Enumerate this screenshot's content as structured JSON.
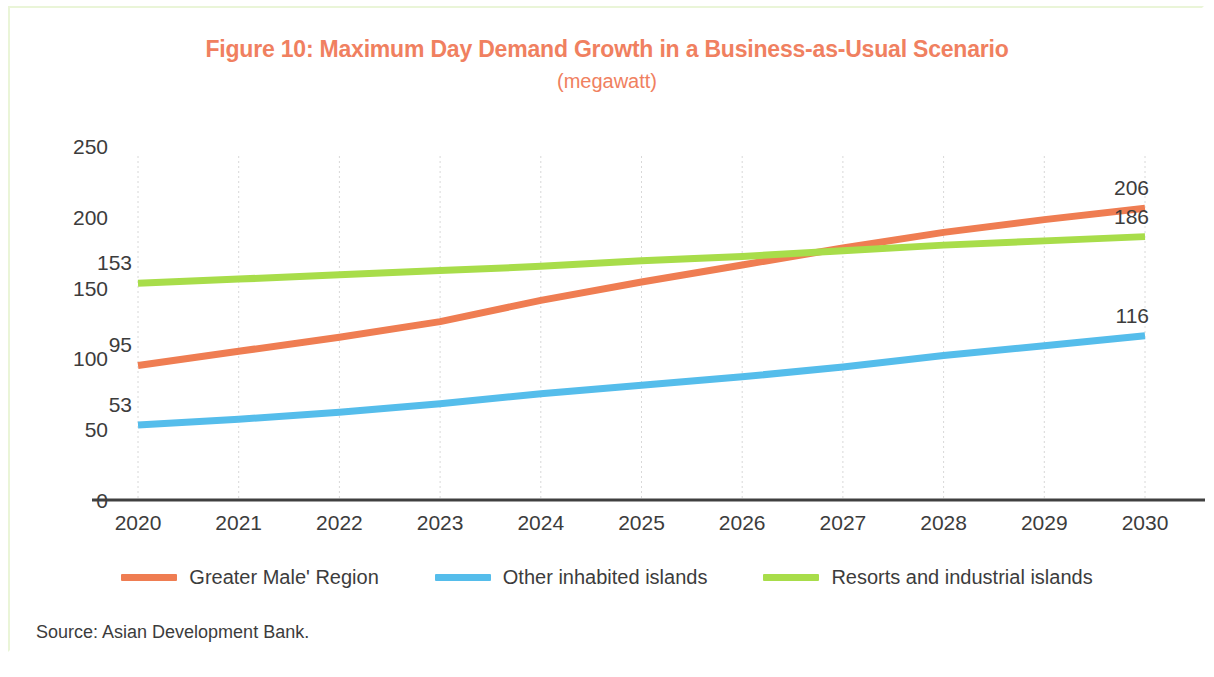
{
  "figure": {
    "title": "Figure 10: Maximum Day Demand Growth in a Business-as-Usual Scenario",
    "subtitle": "(megawatt)",
    "source": "Source: Asian Development Bank."
  },
  "colors": {
    "title": "#f08060",
    "greater_male": "#ef7d52",
    "other_islands": "#55bdeb",
    "resorts": "#a8dd4a",
    "axis": "#404040",
    "grid": "#d8d8d8",
    "text": "#3c3c3c",
    "border": "#eaf5d8"
  },
  "chart_data": {
    "type": "line",
    "title": "Figure 10: Maximum Day Demand Growth in a Business-as-Usual Scenario",
    "subtitle": "(megawatt)",
    "xlabel": "",
    "ylabel": "",
    "ylim": [
      0,
      250
    ],
    "yticks": [
      "0",
      "50",
      "100",
      "150",
      "200",
      "250"
    ],
    "grid": "vertical",
    "legend_position": "bottom",
    "categories": [
      "2020",
      "2021",
      "2022",
      "2023",
      "2024",
      "2025",
      "2026",
      "2027",
      "2028",
      "2029",
      "2030"
    ],
    "series": [
      {
        "name": "Greater Male' Region",
        "color": "#ef7d52",
        "values": [
          95,
          105,
          115,
          126,
          141,
          154,
          166,
          178,
          189,
          198,
          206
        ],
        "start_label": "95",
        "end_label": "206"
      },
      {
        "name": "Other inhabited islands",
        "color": "#55bdeb",
        "values": [
          53,
          57,
          62,
          68,
          75,
          81,
          87,
          94,
          102,
          109,
          116
        ],
        "start_label": "53",
        "end_label": "116"
      },
      {
        "name": "Resorts and industrial islands",
        "color": "#a8dd4a",
        "values": [
          153,
          156,
          159,
          162,
          165,
          169,
          172,
          176,
          180,
          183,
          186
        ],
        "start_label": "153",
        "end_label": "186"
      }
    ]
  },
  "legend": {
    "items": [
      {
        "label": "Greater Male' Region",
        "color": "#ef7d52"
      },
      {
        "label": "Other inhabited islands",
        "color": "#55bdeb"
      },
      {
        "label": "Resorts and industrial islands",
        "color": "#a8dd4a"
      }
    ]
  }
}
